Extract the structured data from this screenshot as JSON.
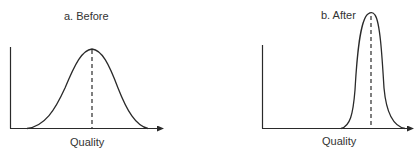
{
  "figure": {
    "panels": [
      {
        "id": "a",
        "title": "a. Before",
        "xlabel": "Quality",
        "curve": "wide bell-shaped distribution",
        "mean_marker": "dashed vertical line at peak"
      },
      {
        "id": "b",
        "title": "b. After",
        "xlabel": "Quality",
        "curve": "narrow tall distribution shifted right",
        "mean_marker": "dashed vertical line at peak"
      }
    ],
    "colors": {
      "line": "#2a2a2a",
      "background": "#ffffff"
    }
  }
}
